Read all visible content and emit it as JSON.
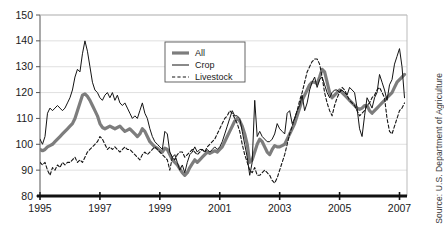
{
  "chart_data": {
    "type": "line",
    "title": "",
    "subtitle": "",
    "xlabel": "",
    "ylabel": "",
    "xlim": [
      1995.0,
      2007.25
    ],
    "ylim": [
      80,
      150
    ],
    "grid": true,
    "grid_axis": "y",
    "legend_position": "top-center",
    "x_tick_labels": [
      "1995",
      "1997",
      "1999",
      "2001",
      "2003",
      "2005",
      "2007"
    ],
    "x_tick_values": [
      1995,
      1997,
      1999,
      2001,
      2003,
      2005,
      2007
    ],
    "y_tick_labels": [
      "80",
      "90",
      "100",
      "110",
      "120",
      "130",
      "140",
      "150"
    ],
    "y_tick_values": [
      80,
      90,
      100,
      110,
      120,
      130,
      140,
      150
    ],
    "source": "Source: U.S. Department of Agriculture",
    "series": [
      {
        "name": "All",
        "style": "solid-thick",
        "color": "#7d7d7d",
        "width": 3.2,
        "x": [
          1995.0,
          1995.083,
          1995.167,
          1995.25,
          1995.333,
          1995.417,
          1995.5,
          1995.583,
          1995.667,
          1995.75,
          1995.833,
          1995.917,
          1996.0,
          1996.083,
          1996.167,
          1996.25,
          1996.333,
          1996.417,
          1996.5,
          1996.583,
          1996.667,
          1996.75,
          1996.833,
          1996.917,
          1997.0,
          1997.083,
          1997.167,
          1997.25,
          1997.333,
          1997.417,
          1997.5,
          1997.583,
          1997.667,
          1997.75,
          1997.833,
          1997.917,
          1998.0,
          1998.083,
          1998.167,
          1998.25,
          1998.333,
          1998.417,
          1998.5,
          1998.583,
          1998.667,
          1998.75,
          1998.833,
          1998.917,
          1999.0,
          1999.083,
          1999.167,
          1999.25,
          1999.333,
          1999.417,
          1999.5,
          1999.583,
          1999.667,
          1999.75,
          1999.833,
          1999.917,
          2000.0,
          2000.083,
          2000.167,
          2000.25,
          2000.333,
          2000.417,
          2000.5,
          2000.583,
          2000.667,
          2000.75,
          2000.833,
          2000.917,
          2001.0,
          2001.083,
          2001.167,
          2001.25,
          2001.333,
          2001.417,
          2001.5,
          2001.583,
          2001.667,
          2001.75,
          2001.833,
          2001.917,
          2002.0,
          2002.083,
          2002.167,
          2002.25,
          2002.333,
          2002.417,
          2002.5,
          2002.583,
          2002.667,
          2002.75,
          2002.833,
          2002.917,
          2003.0,
          2003.083,
          2003.167,
          2003.25,
          2003.333,
          2003.417,
          2003.5,
          2003.583,
          2003.667,
          2003.75,
          2003.833,
          2003.917,
          2004.0,
          2004.083,
          2004.167,
          2004.25,
          2004.333,
          2004.417,
          2004.5,
          2004.583,
          2004.667,
          2004.75,
          2004.833,
          2004.917,
          2005.0,
          2005.083,
          2005.167,
          2005.25,
          2005.333,
          2005.417,
          2005.5,
          2005.583,
          2005.667,
          2005.75,
          2005.833,
          2005.917,
          2006.0,
          2006.083,
          2006.167,
          2006.25,
          2006.333,
          2006.417,
          2006.5,
          2006.583,
          2006.667,
          2006.75,
          2006.833,
          2006.917,
          2007.0,
          2007.083,
          2007.167
        ],
        "values": [
          98,
          97.5,
          98,
          99,
          99.5,
          100,
          101,
          102,
          103,
          104,
          105,
          106,
          107,
          108,
          110,
          113,
          116,
          119,
          119.5,
          118.5,
          117,
          115,
          113,
          111,
          108,
          106.5,
          106,
          106.5,
          107,
          106.5,
          106,
          106.5,
          107,
          106,
          105,
          105.5,
          106,
          105,
          104,
          103,
          104,
          106,
          105,
          103,
          101,
          100,
          99,
          98.5,
          97.5,
          97,
          98.5,
          98,
          96,
          94,
          93,
          92,
          90.5,
          89,
          88,
          89,
          91,
          92.5,
          94,
          93,
          94,
          95,
          96,
          97,
          96.5,
          97,
          97.5,
          97,
          98,
          99,
          101,
          103,
          105,
          107,
          109,
          110,
          109,
          107,
          104,
          100,
          93,
          94,
          97,
          100,
          102,
          101,
          99,
          97,
          96,
          98,
          99.5,
          99,
          99,
          99.5,
          100,
          102,
          104,
          106,
          108,
          111,
          114,
          117,
          119,
          121,
          123,
          124,
          124,
          123.5,
          126,
          129,
          128,
          124,
          120,
          118,
          119,
          120,
          121,
          120,
          119,
          118,
          117,
          116,
          115,
          114,
          113.5,
          114,
          115,
          115,
          113,
          112,
          113,
          114,
          115,
          116,
          117,
          118,
          119,
          120,
          122,
          124,
          125,
          126,
          127
        ]
      },
      {
        "name": "Crop",
        "style": "solid-thin",
        "color": "#141414",
        "width": 1.0,
        "x": [
          1995.0,
          1995.083,
          1995.167,
          1995.25,
          1995.333,
          1995.417,
          1995.5,
          1995.583,
          1995.667,
          1995.75,
          1995.833,
          1995.917,
          1996.0,
          1996.083,
          1996.167,
          1996.25,
          1996.333,
          1996.417,
          1996.5,
          1996.583,
          1996.667,
          1996.75,
          1996.833,
          1996.917,
          1997.0,
          1997.083,
          1997.167,
          1997.25,
          1997.333,
          1997.417,
          1997.5,
          1997.583,
          1997.667,
          1997.75,
          1997.833,
          1997.917,
          1998.0,
          1998.083,
          1998.167,
          1998.25,
          1998.333,
          1998.417,
          1998.5,
          1998.583,
          1998.667,
          1998.75,
          1998.833,
          1998.917,
          1999.0,
          1999.083,
          1999.167,
          1999.25,
          1999.333,
          1999.417,
          1999.5,
          1999.583,
          1999.667,
          1999.75,
          1999.833,
          1999.917,
          2000.0,
          2000.083,
          2000.167,
          2000.25,
          2000.333,
          2000.417,
          2000.5,
          2000.583,
          2000.667,
          2000.75,
          2000.833,
          2000.917,
          2001.0,
          2001.083,
          2001.167,
          2001.25,
          2001.333,
          2001.417,
          2001.5,
          2001.583,
          2001.667,
          2001.75,
          2001.833,
          2001.917,
          2002.0,
          2002.083,
          2002.167,
          2002.25,
          2002.333,
          2002.417,
          2002.5,
          2002.583,
          2002.667,
          2002.75,
          2002.833,
          2002.917,
          2003.0,
          2003.083,
          2003.167,
          2003.25,
          2003.333,
          2003.417,
          2003.5,
          2003.583,
          2003.667,
          2003.75,
          2003.833,
          2003.917,
          2004.0,
          2004.083,
          2004.167,
          2004.25,
          2004.333,
          2004.417,
          2004.5,
          2004.583,
          2004.667,
          2004.75,
          2004.833,
          2004.917,
          2005.0,
          2005.083,
          2005.167,
          2005.25,
          2005.333,
          2005.417,
          2005.5,
          2005.583,
          2005.667,
          2005.75,
          2005.833,
          2005.917,
          2006.0,
          2006.083,
          2006.167,
          2006.25,
          2006.333,
          2006.417,
          2006.5,
          2006.583,
          2006.667,
          2006.75,
          2006.833,
          2006.917,
          2007.0,
          2007.083,
          2007.167
        ],
        "values": [
          102,
          100,
          103,
          112,
          114,
          113,
          114,
          115,
          114,
          113,
          114,
          116,
          118,
          121,
          126,
          129,
          128,
          135,
          140,
          136,
          130,
          124,
          121,
          120,
          118,
          117,
          119,
          120,
          118,
          120,
          117,
          119,
          116,
          115,
          116,
          114,
          112,
          110,
          111,
          110,
          113,
          116,
          112,
          110,
          106,
          103,
          101,
          100,
          99,
          98,
          105,
          104,
          97,
          95,
          96,
          93,
          90,
          92,
          89,
          93,
          96,
          97,
          99,
          97,
          98,
          98,
          97,
          98,
          97,
          98,
          99,
          98,
          99,
          101,
          104,
          107,
          110,
          113,
          111,
          111,
          110,
          105,
          100,
          95,
          88,
          93,
          117,
          103,
          105,
          103,
          102,
          101,
          101,
          102,
          104,
          108,
          106,
          105,
          104,
          112,
          113,
          108,
          110,
          113,
          115,
          119,
          113,
          116,
          121,
          124,
          126,
          122,
          125,
          126,
          123,
          120,
          118,
          120,
          121,
          121,
          120,
          121,
          120,
          119,
          122,
          121,
          120,
          114,
          106,
          103,
          111,
          118,
          116,
          114,
          118,
          120,
          127,
          124,
          121,
          117,
          123,
          125,
          131,
          134,
          137,
          130,
          118
        ]
      },
      {
        "name": "Livestock",
        "style": "dashed",
        "color": "#141414",
        "width": 1.1,
        "x": [
          1995.0,
          1995.083,
          1995.167,
          1995.25,
          1995.333,
          1995.417,
          1995.5,
          1995.583,
          1995.667,
          1995.75,
          1995.833,
          1995.917,
          1996.0,
          1996.083,
          1996.167,
          1996.25,
          1996.333,
          1996.417,
          1996.5,
          1996.583,
          1996.667,
          1996.75,
          1996.833,
          1996.917,
          1997.0,
          1997.083,
          1997.167,
          1997.25,
          1997.333,
          1997.417,
          1997.5,
          1997.583,
          1997.667,
          1997.75,
          1997.833,
          1997.917,
          1998.0,
          1998.083,
          1998.167,
          1998.25,
          1998.333,
          1998.417,
          1998.5,
          1998.583,
          1998.667,
          1998.75,
          1998.833,
          1998.917,
          1999.0,
          1999.083,
          1999.167,
          1999.25,
          1999.333,
          1999.417,
          1999.5,
          1999.583,
          1999.667,
          1999.75,
          1999.833,
          1999.917,
          2000.0,
          2000.083,
          2000.167,
          2000.25,
          2000.333,
          2000.417,
          2000.5,
          2000.583,
          2000.667,
          2000.75,
          2000.833,
          2000.917,
          2001.0,
          2001.083,
          2001.167,
          2001.25,
          2001.333,
          2001.417,
          2001.5,
          2001.583,
          2001.667,
          2001.75,
          2001.833,
          2001.917,
          2002.0,
          2002.083,
          2002.167,
          2002.25,
          2002.333,
          2002.417,
          2002.5,
          2002.583,
          2002.667,
          2002.75,
          2002.833,
          2002.917,
          2003.0,
          2003.083,
          2003.167,
          2003.25,
          2003.333,
          2003.417,
          2003.5,
          2003.583,
          2003.667,
          2003.75,
          2003.833,
          2003.917,
          2004.0,
          2004.083,
          2004.167,
          2004.25,
          2004.333,
          2004.417,
          2004.5,
          2004.583,
          2004.667,
          2004.75,
          2004.833,
          2004.917,
          2005.0,
          2005.083,
          2005.167,
          2005.25,
          2005.333,
          2005.417,
          2005.5,
          2005.583,
          2005.667,
          2005.75,
          2005.833,
          2005.917,
          2006.0,
          2006.083,
          2006.167,
          2006.25,
          2006.333,
          2006.417,
          2006.5,
          2006.583,
          2006.667,
          2006.75,
          2006.833,
          2006.917,
          2007.0,
          2007.083,
          2007.167
        ],
        "values": [
          93,
          92,
          93,
          90,
          88,
          91,
          90,
          92,
          91,
          93,
          92,
          93,
          93,
          94,
          95,
          93,
          94,
          93,
          95,
          97,
          98,
          99,
          100,
          101,
          103,
          102,
          100,
          98,
          99,
          98,
          99,
          98,
          97,
          98,
          99,
          98,
          98,
          97,
          96,
          95,
          94,
          96,
          97,
          96,
          97,
          98,
          99,
          98,
          97,
          96,
          95,
          94,
          90,
          95,
          94,
          96,
          97,
          97,
          95,
          96,
          97,
          98,
          97,
          96,
          97,
          98,
          97,
          99,
          100,
          101,
          102,
          104,
          106,
          108,
          110,
          111,
          113,
          112,
          110,
          108,
          105,
          100,
          96,
          93,
          90,
          89,
          91,
          88,
          88,
          89,
          90,
          89,
          88,
          86,
          85,
          87,
          90,
          93,
          96,
          100,
          104,
          107,
          110,
          113,
          117,
          120,
          124,
          128,
          130,
          132,
          133,
          133,
          131,
          126,
          120,
          116,
          113,
          111,
          115,
          118,
          120,
          122,
          121,
          119,
          117,
          116,
          115,
          113,
          111,
          112,
          113,
          115,
          116,
          118,
          119,
          121,
          122,
          120,
          118,
          110,
          105,
          104,
          107,
          110,
          113,
          114,
          116
        ]
      }
    ]
  },
  "legend": {
    "items": [
      {
        "label": "All"
      },
      {
        "label": "Crop"
      },
      {
        "label": "Livestock"
      }
    ]
  },
  "source_note": "Source: U.S. Department of Agriculture"
}
